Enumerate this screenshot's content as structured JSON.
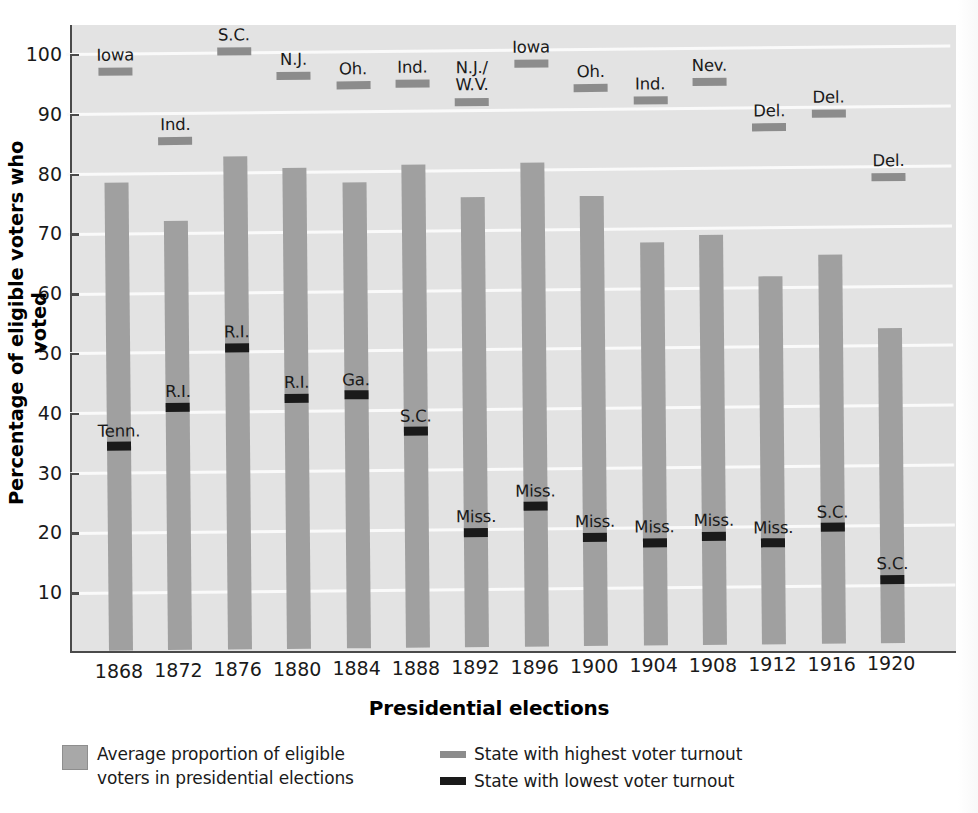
{
  "chart_data": {
    "type": "bar",
    "title": "",
    "xlabel": "Presidential elections",
    "ylabel": "Percentage of eligible voters who voted",
    "ylim": [
      0,
      105
    ],
    "yticks": [
      10,
      20,
      30,
      40,
      50,
      60,
      70,
      80,
      90,
      100
    ],
    "grid": true,
    "legend_position": "below",
    "categories": [
      "1868",
      "1872",
      "1876",
      "1880",
      "1884",
      "1888",
      "1892",
      "1896",
      "1900",
      "1904",
      "1908",
      "1912",
      "1916",
      "1920"
    ],
    "series": [
      {
        "name": "Average proportion of eligible voters in presidential elections",
        "type": "bar",
        "color": "#a0a0a0",
        "values": [
          78.2,
          71.8,
          82.5,
          80.4,
          78.0,
          80.8,
          75.3,
          81.0,
          75.3,
          67.4,
          68.5,
          61.5,
          65.0,
          52.7
        ]
      },
      {
        "name": "State with highest voter turnout",
        "type": "marker",
        "color": "#8c8c8c",
        "values": [
          97.2,
          85.5,
          100.3,
          96.2,
          94.5,
          94.7,
          91.5,
          97.8,
          93.6,
          91.5,
          94.5,
          86.7,
          89.0,
          78.2
        ],
        "labels": [
          "Iowa",
          "Ind.",
          "S.C.",
          "N.J.",
          "Oh.",
          "Ind.",
          "N.J./\nW.V.",
          "Iowa",
          "Oh.",
          "Ind.",
          "Nev.",
          "Del.",
          "Del.",
          "Del."
        ]
      },
      {
        "name": "State with lowest voter turnout",
        "type": "marker",
        "color": "#1a1a1a",
        "values": [
          34.5,
          40.9,
          50.8,
          42.3,
          42.7,
          36.5,
          19.5,
          23.8,
          18.5,
          17.5,
          18.5,
          17.3,
          19.8,
          11.0
        ],
        "labels": [
          "Tenn.",
          "R.I.",
          "R.I.",
          "R.I.",
          "Ga.",
          "S.C.",
          "Miss.",
          "Miss.",
          "Miss.",
          "Miss.",
          "Miss.",
          "Miss.",
          "S.C.",
          "S.C."
        ]
      }
    ]
  },
  "axes": {
    "y_title": "Percentage of eligible voters who voted",
    "x_title": "Presidential elections",
    "y_tick_labels": [
      "100",
      "90",
      "80",
      "70",
      "60",
      "50",
      "40",
      "30",
      "20",
      "10"
    ],
    "x_tick_labels": [
      "1868",
      "1872",
      "1876",
      "1880",
      "1884",
      "1888",
      "1892",
      "1896",
      "1900",
      "1904",
      "1908",
      "1912",
      "1916",
      "1920"
    ]
  },
  "legend": {
    "average_label_line1": "Average proportion of eligible",
    "average_label_line2": "voters in presidential elections",
    "highest_label": "State with highest voter turnout",
    "lowest_label": "State with lowest voter turnout"
  },
  "colors": {
    "bar": "#a0a0a0",
    "highest_marker": "#8c8c8c",
    "lowest_marker": "#1a1a1a",
    "plot_background": "#e3e3e3",
    "gridline": "#fafafa",
    "axis": "#4a4a4a",
    "text": "#1a1a1a"
  }
}
